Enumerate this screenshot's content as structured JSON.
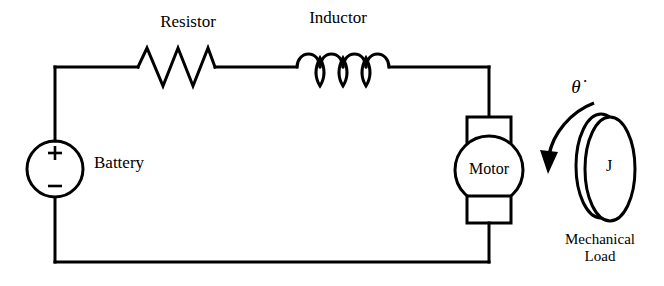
{
  "diagram": {
    "type": "electrical-circuit-schematic",
    "background_color": "#ffffff",
    "line_color": "#000000",
    "components": {
      "battery": {
        "label": "Battery",
        "symbol": "voltage-source-circle",
        "positive_terminal": "+",
        "negative_terminal": "−"
      },
      "resistor": {
        "label": "Resistor",
        "symbol": "zigzag",
        "zigzag_peaks": 3
      },
      "inductor": {
        "label": "Inductor",
        "symbol": "coil",
        "coil_loops": 4
      },
      "motor": {
        "label": "Motor",
        "symbol": "circle-with-brushes"
      },
      "mechanical_load": {
        "label_line_1": "Mechanical",
        "label_line_2": "Load",
        "inertia_symbol": "J",
        "angular_velocity_symbol": "θ̇",
        "rotation_arrow": "curved-arrow-clockwise",
        "symbol": "rotating-disk"
      }
    }
  }
}
